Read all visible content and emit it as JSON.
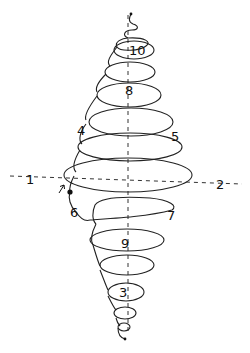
{
  "diagram": {
    "colors": {
      "ink": "#222222",
      "background": "#ffffff"
    },
    "axes": {
      "vertical": {
        "x": 128,
        "y1": 15,
        "y2": 335,
        "style": "dashed"
      },
      "horizontal": {
        "x1": 10,
        "y1": 176,
        "x2": 242,
        "y2": 184,
        "style": "dashed"
      }
    },
    "labels": [
      {
        "id": "1",
        "text": "1",
        "x": 26,
        "y": 184
      },
      {
        "id": "2",
        "text": "2",
        "x": 216,
        "y": 189
      },
      {
        "id": "3",
        "text": "3",
        "x": 119,
        "y": 297
      },
      {
        "id": "4",
        "text": "4",
        "x": 77,
        "y": 135
      },
      {
        "id": "5",
        "text": "5",
        "x": 171,
        "y": 141
      },
      {
        "id": "6",
        "text": "6",
        "x": 70,
        "y": 217
      },
      {
        "id": "7",
        "text": "7",
        "x": 167,
        "y": 220
      },
      {
        "id": "8",
        "text": "8",
        "x": 125,
        "y": 95
      },
      {
        "id": "9",
        "text": "9",
        "x": 121,
        "y": 248
      },
      {
        "id": "10",
        "text": "10",
        "x": 129,
        "y": 55
      }
    ],
    "markers": {
      "start_dot": {
        "x": 70,
        "y": 192
      },
      "top_dot": {
        "x": 131,
        "y": 14
      },
      "bottom_dot": {
        "x": 125,
        "y": 339
      },
      "arrow": {
        "x": 62,
        "y": 188,
        "direction": "up-right"
      }
    }
  }
}
